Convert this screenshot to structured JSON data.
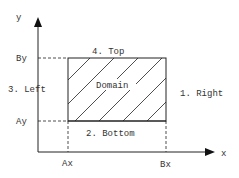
{
  "diagram": {
    "axes": {
      "y_label": "y",
      "x_label": "x"
    },
    "ticks": {
      "by": "By",
      "ay": "Ay",
      "ax": "Ax",
      "bx": "Bx"
    },
    "domain": {
      "label": "Domain",
      "hatch": "diagonal"
    },
    "boundaries": {
      "right": "1. Right",
      "bottom": "2. Bottom",
      "left": "3. Left",
      "top": "4. Top"
    },
    "colors": {
      "line": "#222222",
      "text": "#333333",
      "background": "#ffffff"
    }
  }
}
